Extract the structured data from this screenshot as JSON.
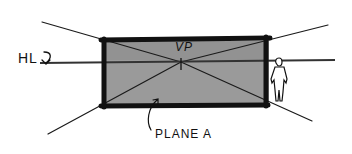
{
  "diagram": {
    "labels": {
      "horizon_line": "HL",
      "vanishing_point": "VP",
      "plane": "PLANE A"
    },
    "elements": {
      "picture_plane": {
        "x": 102,
        "y": 40,
        "width": 168,
        "height": 66,
        "fill": "#9a9a9a",
        "border": "#111111"
      },
      "horizon_line": {
        "y": 61,
        "x1": 40,
        "x2": 335
      },
      "vanishing_point": {
        "x": 181,
        "y": 62
      },
      "convergence_lines": [
        {
          "from": [
            42,
            22
          ],
          "to": [
            181,
            62
          ]
        },
        {
          "from": [
            48,
            134
          ],
          "to": [
            181,
            62
          ]
        },
        {
          "from": [
            328,
            25
          ],
          "to": [
            181,
            62
          ]
        },
        {
          "from": [
            312,
            121
          ],
          "to": [
            181,
            62
          ]
        }
      ],
      "human_figure": {
        "x": 272,
        "y": 57,
        "height": 45
      }
    },
    "colors": {
      "ink": "#111111",
      "plane_fill": "#9a9a9a",
      "background": "#ffffff"
    }
  }
}
